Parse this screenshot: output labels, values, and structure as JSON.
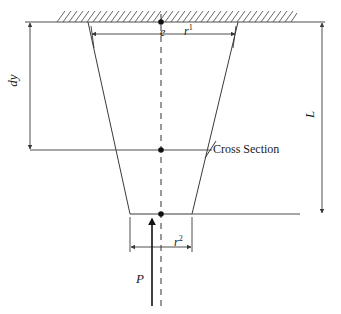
{
  "figure": {
    "type": "engineering-diagram",
    "background_color": "#ffffff",
    "line_color": "#4d4d4d",
    "text_color": "#1a1a1a",
    "labels": {
      "dy": "dy",
      "L": "L",
      "e": "e",
      "r_top_base": "r",
      "r_top_sup": "1",
      "r_bottom_base": "r",
      "r_bottom_sup": "2",
      "P": "P",
      "cross_section": "Cross Section"
    },
    "geometry": {
      "ground_line": {
        "x1": 25,
        "x2": 325,
        "y": 22
      },
      "hatch": {
        "x1": 55,
        "x2": 290,
        "y_top": 9,
        "y_bottom": 22,
        "angle_deg": 60
      },
      "trapezoid": {
        "top_left_x": 88,
        "top_right_x": 238,
        "bottom_left_x": 130,
        "bottom_right_x": 192,
        "top_y": 22,
        "bottom_y": 214
      },
      "centerline": {
        "x": 161,
        "y_top": 14,
        "y_bottom": 306
      },
      "cross_section_line": {
        "x1": 30,
        "x2": 217,
        "y": 150
      },
      "bottom_line": {
        "x1": 130,
        "x2": 300,
        "y": 214
      },
      "dim_dy": {
        "x": 30,
        "y_top": 22,
        "y_bottom": 150
      },
      "dim_L": {
        "x": 322,
        "y_top": 22,
        "y_bottom": 214
      },
      "dim_r1": {
        "y": 33,
        "x_left": 88,
        "x_right": 238
      },
      "dim_r2": {
        "y": 247,
        "x_left": 130,
        "x_right": 192
      },
      "load_arrow": {
        "x": 152,
        "y_tail": 306,
        "y_head": 219
      },
      "node_points": [
        {
          "x": 161,
          "y": 22
        },
        {
          "x": 161,
          "y": 150
        },
        {
          "x": 161,
          "y": 214
        }
      ]
    }
  }
}
